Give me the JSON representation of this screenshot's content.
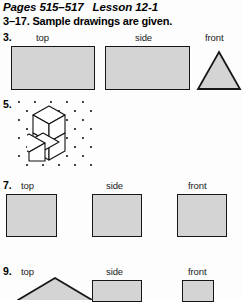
{
  "header": {
    "pages": "Pages 515–517",
    "lesson": "Lesson 12-1",
    "instruction": "3–17. Sample drawings are given."
  },
  "colors": {
    "shape_fill": "#d4d4d4",
    "shape_stroke": "#171717",
    "text": "#000000",
    "page_background": "#fdfdfd",
    "dot": "#1a1a1a"
  },
  "view_labels": {
    "top": "top",
    "side": "side",
    "front": "front"
  },
  "problems": [
    {
      "number": "3.",
      "labels": [
        "top",
        "side",
        "front"
      ],
      "views": [
        {
          "name": "top-view",
          "shape": "rectangle"
        },
        {
          "name": "side-view",
          "shape": "rectangle"
        },
        {
          "name": "front-view",
          "shape": "triangle"
        }
      ]
    },
    {
      "number": "5.",
      "labels": [],
      "views": [
        {
          "name": "isometric-cube-drawing",
          "shape": "isometric-dot-grid-with-cubes",
          "cube_count": 3
        }
      ]
    },
    {
      "number": "7.",
      "labels": [
        "top",
        "side",
        "front"
      ],
      "views": [
        {
          "name": "top-view",
          "shape": "square"
        },
        {
          "name": "side-view",
          "shape": "square"
        },
        {
          "name": "front-view",
          "shape": "square"
        }
      ]
    },
    {
      "number": "9.",
      "labels": [
        "top",
        "side",
        "front"
      ],
      "views": [
        {
          "name": "top-view",
          "shape": "pentagon-peak"
        },
        {
          "name": "side-view",
          "shape": "rectangle"
        },
        {
          "name": "front-view",
          "shape": "rectangle"
        }
      ]
    }
  ]
}
